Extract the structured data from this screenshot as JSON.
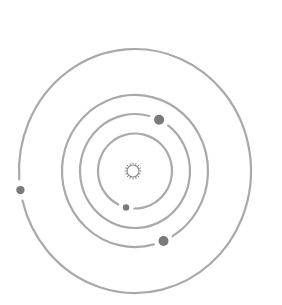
{
  "diagram": {
    "type": "solar-system",
    "background": "#ffffff",
    "center": {
      "x": 135,
      "y": 171
    },
    "sun": {
      "x": 133,
      "y": 171,
      "r": 6,
      "rays": 16,
      "ray_length": 2.5,
      "color": "#8a8a8a"
    },
    "orbit_color": "#a9a9a9",
    "orbit_width": 2.2,
    "planet_color": "#7a7a7a",
    "orbits": [
      {
        "name": "orbit-1",
        "rx": 37,
        "ry": 37.5,
        "planet": {
          "angle_deg": 104,
          "r": 3.2
        },
        "gap_deg": 26
      },
      {
        "name": "orbit-2",
        "rx": 55,
        "ry": 57,
        "planet": {
          "angle_deg": -64,
          "r": 5
        },
        "gap_deg": 22
      },
      {
        "name": "orbit-3",
        "rx": 73,
        "ry": 76,
        "planet": {
          "angle_deg": 67,
          "r": 5
        },
        "gap_deg": 16
      },
      {
        "name": "orbit-4",
        "rx": 116,
        "ry": 122,
        "planet": {
          "angle_deg": 171,
          "r": 4.2
        },
        "gap_deg": 10
      }
    ]
  }
}
